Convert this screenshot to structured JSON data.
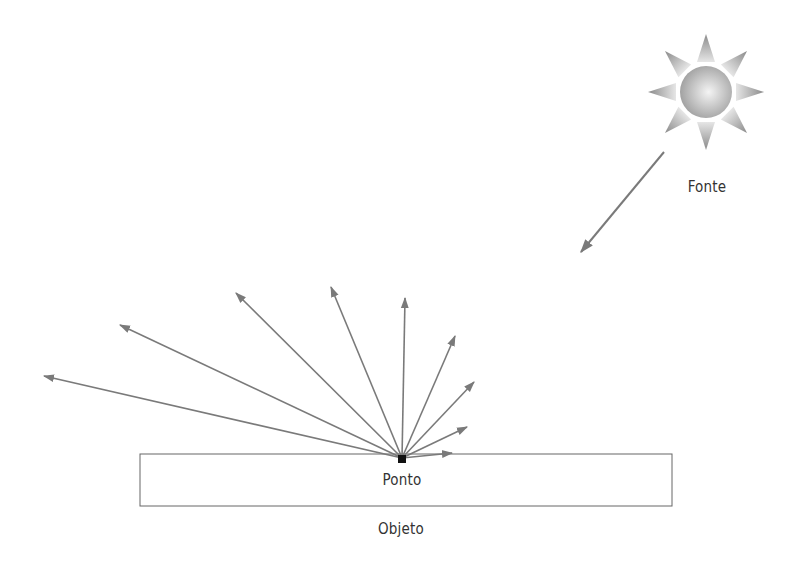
{
  "diagram": {
    "labels": {
      "source": "Fonte",
      "point": "Ponto",
      "object": "Objeto"
    },
    "colors": {
      "arrow": "#7a7a7a",
      "object_border": "#666666",
      "point": "#111111",
      "sun_core_light": "#f2f2f2",
      "sun_core_dark": "#9a9a9a",
      "text": "#333333"
    },
    "source": {
      "icon": "sun-icon",
      "center": [
        706,
        92
      ]
    },
    "incident_ray": {
      "from": [
        664,
        152
      ],
      "to": [
        581,
        252
      ]
    },
    "point": {
      "position": [
        402,
        458
      ]
    },
    "object": {
      "x": 140,
      "y": 454,
      "width": 532,
      "height": 52
    },
    "reflected_rays": [
      {
        "to": [
          44,
          376
        ]
      },
      {
        "to": [
          120,
          325
        ]
      },
      {
        "to": [
          236,
          293
        ]
      },
      {
        "to": [
          331,
          287
        ]
      },
      {
        "to": [
          405,
          298
        ]
      },
      {
        "to": [
          455,
          336
        ]
      },
      {
        "to": [
          474,
          382
        ]
      },
      {
        "to": [
          467,
          427
        ]
      },
      {
        "to": [
          452,
          453
        ]
      }
    ]
  }
}
